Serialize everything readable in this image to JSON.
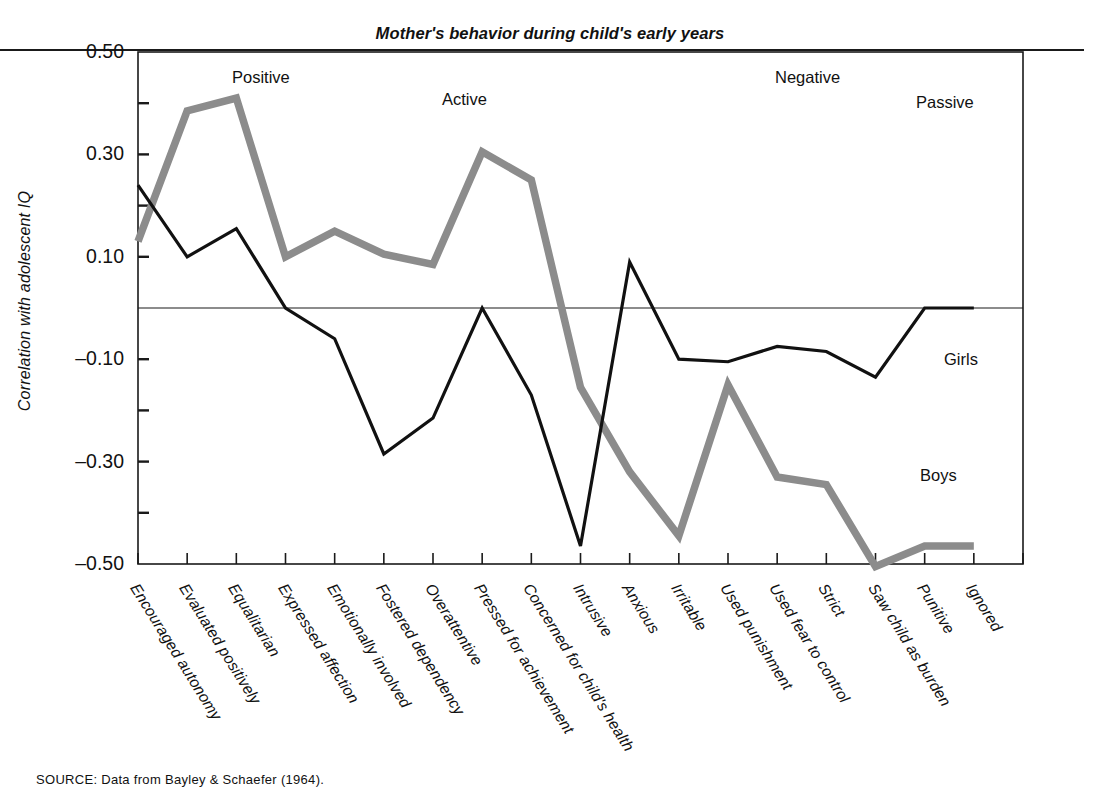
{
  "figure": {
    "title": "Mother's behavior during child's early years",
    "ylabel": "Correlation with adolescent IQ",
    "source": "SOURCE: Data from Bayley & Schaefer (1964)."
  },
  "group_labels": [
    {
      "text": "Positive",
      "x": 232,
      "y": 68
    },
    {
      "text": "Active",
      "x": 442,
      "y": 90
    },
    {
      "text": "Negative",
      "x": 775,
      "y": 68
    },
    {
      "text": "Passive",
      "x": 916,
      "y": 93
    }
  ],
  "series_labels": [
    {
      "text": "Girls",
      "x": 944,
      "y": 350
    },
    {
      "text": "Boys",
      "x": 920,
      "y": 466
    }
  ],
  "axis": {
    "y_ticks_major": [
      "0.50",
      "0.30",
      "0.10",
      "–0.10",
      "–0.30",
      "–0.50"
    ],
    "y_major_values": [
      0.5,
      0.3,
      0.1,
      -0.1,
      -0.3,
      -0.5
    ],
    "y_minor_values": [
      0.4,
      0.2,
      0.0,
      -0.2,
      -0.4
    ],
    "ylim": [
      -0.5,
      0.5
    ],
    "zero_line": 0.0
  },
  "chart_data": {
    "type": "line",
    "title": "Mother's behavior during child's early years",
    "xlabel": "",
    "ylabel": "Correlation with adolescent IQ",
    "ylim": [
      -0.5,
      0.5
    ],
    "grid": false,
    "legend": "inline-labels",
    "categories": [
      "Encouraged autonomy",
      "Evaluated positively",
      "Equalitarian",
      "Expressed affection",
      "Emotionally involved",
      "Fostered dependency",
      "Overattentive",
      "Pressed for achievement",
      "Concerned for child's health",
      "Intrusive",
      "Anxious",
      "Irritable",
      "Used punishment",
      "Used fear to control",
      "Strict",
      "Saw child as burden",
      "Punitive",
      "Ignored"
    ],
    "category_groups": [
      {
        "name": "Positive",
        "start": 0,
        "end": 4
      },
      {
        "name": "Active",
        "start": 5,
        "end": 8
      },
      {
        "name": "Negative",
        "start": 9,
        "end": 14
      },
      {
        "name": "Passive",
        "start": 15,
        "end": 17
      }
    ],
    "series": [
      {
        "name": "Girls",
        "color": "#111111",
        "values": [
          0.24,
          0.1,
          0.155,
          0.0,
          -0.06,
          -0.285,
          -0.215,
          0.0,
          -0.17,
          -0.465,
          0.09,
          -0.1,
          -0.105,
          -0.075,
          -0.085,
          -0.135,
          0.0,
          0.0
        ]
      },
      {
        "name": "Boys",
        "color": "#8c8c8c",
        "values": [
          0.13,
          0.385,
          0.41,
          0.1,
          0.15,
          0.105,
          0.085,
          0.305,
          0.25,
          -0.155,
          -0.32,
          -0.445,
          -0.15,
          -0.33,
          -0.345,
          -0.505,
          -0.465,
          -0.465
        ]
      }
    ]
  }
}
